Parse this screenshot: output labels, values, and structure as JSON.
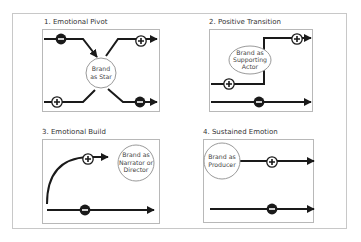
{
  "diagram": {
    "panels": [
      {
        "id": 1,
        "title": "1. Emotional Pivot",
        "brand_label": [
          "Brand",
          "as Star"
        ]
      },
      {
        "id": 2,
        "title": "2. Positive Transition",
        "brand_label": [
          "Brand as",
          "Supporting",
          "Actor"
        ]
      },
      {
        "id": 3,
        "title": "3. Emotional Build",
        "brand_label": [
          "Brand as",
          "Narrator or",
          "Director"
        ]
      },
      {
        "id": 4,
        "title": "4. Sustained Emotion",
        "brand_label": [
          "Brand as",
          "Producer"
        ]
      }
    ],
    "icons": {
      "positive": "plus-circle-icon",
      "negative": "minus-circle-icon",
      "arrow": "arrowhead-icon"
    },
    "colors": {
      "line": "#1a1a1a",
      "box_border": "#b8b8b8",
      "frame_border": "#c8c8c8",
      "brand_circle_border": "#9a9a9a",
      "text": "#444444"
    }
  }
}
